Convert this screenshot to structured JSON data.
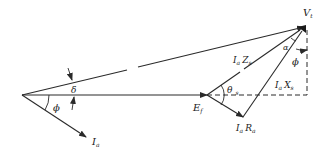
{
  "diagram": {
    "type": "phasor-diagram",
    "colors": {
      "line": "#2a2a2a",
      "background": "#ffffff"
    },
    "labels": {
      "vt": {
        "main": "V",
        "sub": "t"
      },
      "ef": {
        "main": "E",
        "sub": "f"
      },
      "ia": {
        "main": "I",
        "sub": "a"
      },
      "iazs": {
        "main1": "I",
        "sub1": "a",
        "main2": "Z",
        "sub2": "s"
      },
      "iaxs": {
        "main1": "I",
        "sub1": "a",
        "main2": "X",
        "sub2": "s"
      },
      "iara": {
        "main1": "I",
        "sub1": "a",
        "main2": "R",
        "sub2": "a"
      },
      "delta": "δ",
      "phi_left": "ϕ",
      "phi_right": "ϕ",
      "alpha": "α",
      "theta": {
        "main": "θ",
        "sub": "s"
      }
    },
    "phasors": [
      {
        "name": "Vt",
        "from": [
          22,
          95
        ],
        "to": [
          304,
          27
        ]
      },
      {
        "name": "Ef",
        "from": [
          22,
          95
        ],
        "to": [
          207,
          95
        ]
      },
      {
        "name": "Ia",
        "from": [
          22,
          95
        ],
        "to": [
          86,
          137
        ]
      },
      {
        "name": "IaZs",
        "from": [
          207,
          95
        ],
        "to": [
          304,
          27
        ]
      },
      {
        "name": "IaRa",
        "from": [
          207,
          95
        ],
        "to": [
          243,
          117
        ]
      },
      {
        "name": "IaXs",
        "from": [
          243,
          117
        ],
        "to": [
          304,
          27
        ]
      }
    ]
  }
}
